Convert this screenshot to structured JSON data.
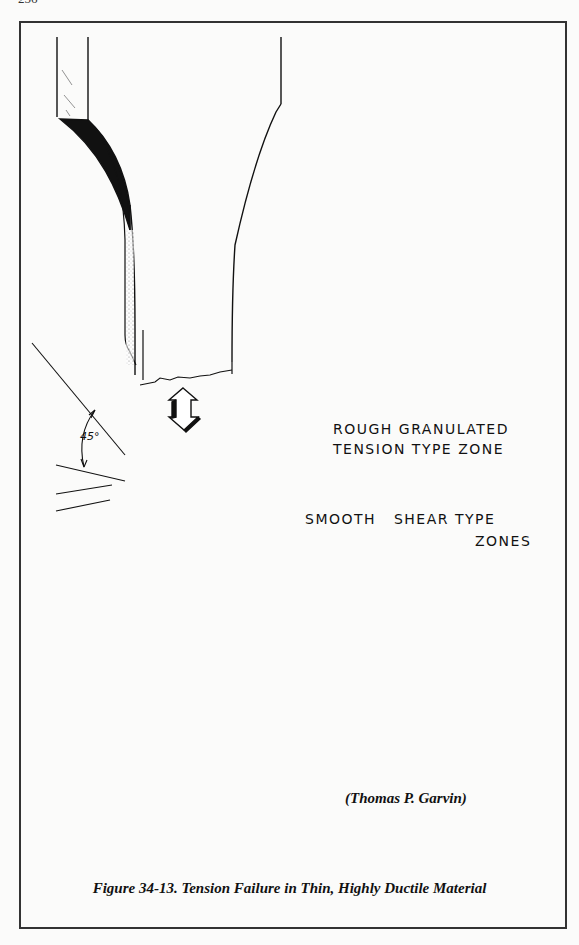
{
  "page": {
    "number": "256"
  },
  "figure": {
    "labels": {
      "rough_zone_line1": "ROUGH GRANULATED",
      "rough_zone_line2": "TENSION TYPE ZONE",
      "shear_zone_line1": "SMOOTH   SHEAR TYPE",
      "shear_zone_line2": "ZONES",
      "angle": "45°"
    },
    "credit": "(Thomas P. Garvin)",
    "caption": "Figure 34-13. Tension Failure in Thin, Highly Ductile Material"
  }
}
